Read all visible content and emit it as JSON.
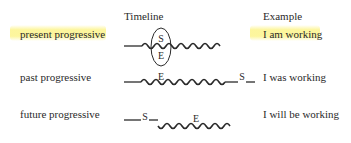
{
  "headers": {
    "timeline": "Timeline",
    "example": "Example"
  },
  "rows": [
    {
      "label": "present progressive",
      "example": "I am working",
      "highlighted": true,
      "markers": [
        "S",
        "E"
      ]
    },
    {
      "label": "past progressive",
      "example": "I was working",
      "highlighted": false,
      "markers": [
        "E",
        "S"
      ]
    },
    {
      "label": "future progressive",
      "example": "I will be working",
      "highlighted": false,
      "markers": [
        "S",
        "E"
      ]
    }
  ],
  "colors": {
    "highlight": "#fcf48c",
    "text": "#2a2a2a"
  }
}
